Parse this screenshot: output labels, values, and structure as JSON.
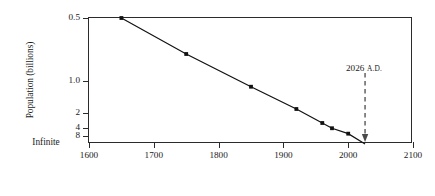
{
  "chart_data": {
    "type": "line",
    "title": "",
    "subtitle": "",
    "xlabel": "Year A.D.",
    "ylabel": "Population (billions)",
    "xlim": [
      1600,
      2100
    ],
    "xticks": [
      1600,
      1700,
      1800,
      1900,
      2000,
      2100
    ],
    "xticklabels": [
      "1600",
      "1700",
      "1800",
      "1900",
      "2000",
      "2100"
    ],
    "yticks": [
      0.5,
      1.0,
      2,
      4,
      8
    ],
    "yticklabels": [
      "0.5",
      "1.0",
      "2",
      "4",
      "8"
    ],
    "y_axis_note": "Reciprocal scale: axis plots 1/population, so 0.5 billion at top and 8 billion near bottom; baseline is labeled Infinite",
    "y_baseline_label": "Infinite",
    "ylim_reciprocal": [
      0,
      2
    ],
    "grid": false,
    "legend": null,
    "series": [
      {
        "name": "World population (doomsday fit)",
        "x": [
          1650,
          1750,
          1850,
          1920,
          1960,
          1975,
          2000
        ],
        "y": [
          0.5,
          0.7,
          1.1,
          1.8,
          3.0,
          4.0,
          6.1
        ],
        "marker": "square",
        "line": "solid"
      }
    ],
    "annotations": [
      {
        "text": "2026 A.D.",
        "text_main": "2026",
        "text_smallcaps": "A.D.",
        "x": 2026,
        "y_points_to": "Infinite",
        "arrow": "dashed-down-arrow"
      }
    ],
    "colors": {
      "axis": "#2b2b2b",
      "line": "#111111",
      "marker": "#111111",
      "annotation": "#4a4a4a",
      "background": "#ffffff"
    }
  }
}
